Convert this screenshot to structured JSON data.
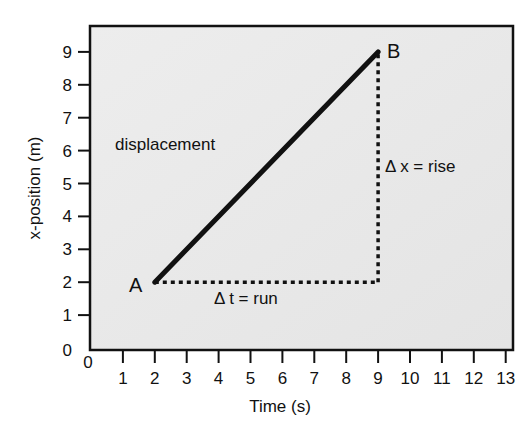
{
  "chart_data": {
    "type": "line",
    "title": "",
    "xlabel": "Time (s)",
    "ylabel": "x-position (m)",
    "xlim": [
      0,
      13
    ],
    "ylim": [
      0,
      9.7
    ],
    "x_ticks": [
      "0",
      "1",
      "2",
      "3",
      "4",
      "5",
      "6",
      "7",
      "8",
      "9",
      "10",
      "11",
      "12",
      "13"
    ],
    "y_ticks": [
      "0",
      "1",
      "2",
      "3",
      "4",
      "5",
      "6",
      "7",
      "8",
      "9"
    ],
    "grid": false,
    "background": "#e9e9e9",
    "series": [
      {
        "name": "displacement",
        "points": [
          {
            "x": 2,
            "y": 2,
            "label": "A"
          },
          {
            "x": 9,
            "y": 9,
            "label": "B"
          }
        ]
      }
    ],
    "guides": [
      {
        "name": "run",
        "from": {
          "x": 2,
          "y": 2
        },
        "to": {
          "x": 9,
          "y": 2
        },
        "style": "dotted"
      },
      {
        "name": "rise",
        "from": {
          "x": 9,
          "y": 2
        },
        "to": {
          "x": 9,
          "y": 9
        },
        "style": "dotted"
      }
    ],
    "annotations": [
      {
        "text": "displacement",
        "x": 1,
        "y": 6.1
      },
      {
        "text": "Δ x = rise",
        "x": 9.2,
        "y": 5.5
      },
      {
        "text": "Δ t = run",
        "x": 4.3,
        "y": 1.6
      }
    ]
  },
  "labels": {
    "xlabel": "Time (s)",
    "ylabel": "x-position (m)",
    "point_a": "A",
    "point_b": "B",
    "displacement": "displacement",
    "rise": "Δ x = rise",
    "run": "Δ t = run"
  }
}
